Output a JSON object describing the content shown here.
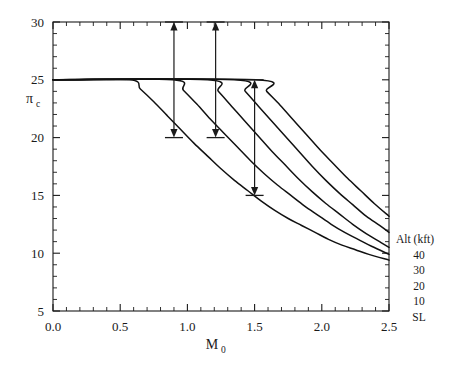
{
  "chart_data": {
    "type": "line",
    "title": "",
    "xlabel": "M_0",
    "xlabel_base": "M",
    "xlabel_sub": "0",
    "ylabel": "pi_c",
    "ylabel_base": "π",
    "ylabel_sub": "c",
    "xlim": [
      0.0,
      2.5
    ],
    "ylim": [
      5,
      30
    ],
    "grid": false,
    "xticks_major": [
      "0.0",
      "0.5",
      "1.0",
      "1.5",
      "2.0",
      "2.5"
    ],
    "xticks_major_values": [
      0.0,
      0.5,
      1.0,
      1.5,
      2.0,
      2.5
    ],
    "xtick_minor_step": 0.1,
    "yticks_major": [
      "5",
      "10",
      "15",
      "20",
      "25",
      "30"
    ],
    "yticks_major_values": [
      5,
      10,
      15,
      20,
      25,
      30
    ],
    "ytick_minor_step": 1,
    "legend_position": "right-outside",
    "legend_title": "Alt (kft)",
    "legend_entries": [
      "40",
      "30",
      "20",
      "10",
      "SL"
    ],
    "series": [
      {
        "name": "40",
        "label": "40",
        "break_x": 0.57,
        "plateau_y": 25,
        "points": [
          [
            0.0,
            25.0
          ],
          [
            0.57,
            25.0
          ],
          [
            0.65,
            24.2
          ],
          [
            0.75,
            23.1
          ],
          [
            0.85,
            21.9
          ],
          [
            0.95,
            20.7
          ],
          [
            1.05,
            19.5
          ],
          [
            1.15,
            18.4
          ],
          [
            1.25,
            17.3
          ],
          [
            1.35,
            16.3
          ],
          [
            1.45,
            15.4
          ],
          [
            1.55,
            14.5
          ],
          [
            1.65,
            13.7
          ],
          [
            1.75,
            13.0
          ],
          [
            1.85,
            12.4
          ],
          [
            1.95,
            11.8
          ],
          [
            2.05,
            11.2
          ],
          [
            2.15,
            10.7
          ],
          [
            2.25,
            10.3
          ],
          [
            2.35,
            9.9
          ],
          [
            2.5,
            9.4
          ]
        ]
      },
      {
        "name": "30",
        "label": "30",
        "break_x": 0.89,
        "plateau_y": 25,
        "points": [
          [
            0.0,
            25.0
          ],
          [
            0.89,
            25.0
          ],
          [
            0.97,
            24.1
          ],
          [
            1.07,
            22.9
          ],
          [
            1.17,
            21.6
          ],
          [
            1.27,
            20.4
          ],
          [
            1.37,
            19.2
          ],
          [
            1.47,
            18.0
          ],
          [
            1.57,
            16.9
          ],
          [
            1.67,
            15.9
          ],
          [
            1.77,
            15.0
          ],
          [
            1.87,
            14.1
          ],
          [
            1.97,
            13.3
          ],
          [
            2.07,
            12.5
          ],
          [
            2.17,
            11.8
          ],
          [
            2.27,
            11.2
          ],
          [
            2.37,
            10.6
          ],
          [
            2.5,
            9.9
          ]
        ]
      },
      {
        "name": "20",
        "label": "20",
        "break_x": 1.15,
        "plateau_y": 25,
        "points": [
          [
            0.0,
            25.0
          ],
          [
            1.15,
            25.0
          ],
          [
            1.23,
            24.0
          ],
          [
            1.33,
            22.7
          ],
          [
            1.43,
            21.4
          ],
          [
            1.53,
            20.1
          ],
          [
            1.63,
            18.8
          ],
          [
            1.73,
            17.6
          ],
          [
            1.83,
            16.4
          ],
          [
            1.93,
            15.3
          ],
          [
            2.03,
            14.3
          ],
          [
            2.13,
            13.4
          ],
          [
            2.23,
            12.5
          ],
          [
            2.33,
            11.7
          ],
          [
            2.43,
            11.0
          ],
          [
            2.5,
            10.5
          ]
        ]
      },
      {
        "name": "10",
        "label": "10",
        "break_x": 1.35,
        "plateau_y": 25,
        "points": [
          [
            0.0,
            25.0
          ],
          [
            1.35,
            25.0
          ],
          [
            1.43,
            24.0
          ],
          [
            1.53,
            22.7
          ],
          [
            1.63,
            21.4
          ],
          [
            1.73,
            20.1
          ],
          [
            1.83,
            18.8
          ],
          [
            1.93,
            17.5
          ],
          [
            2.03,
            16.3
          ],
          [
            2.13,
            15.2
          ],
          [
            2.23,
            14.2
          ],
          [
            2.33,
            13.2
          ],
          [
            2.43,
            12.4
          ],
          [
            2.5,
            11.8
          ]
        ]
      },
      {
        "name": "SL",
        "label": "SL",
        "break_x": 1.51,
        "plateau_y": 25,
        "points": [
          [
            0.0,
            25.0
          ],
          [
            1.51,
            25.0
          ],
          [
            1.59,
            24.0
          ],
          [
            1.69,
            22.8
          ],
          [
            1.79,
            21.5
          ],
          [
            1.89,
            20.2
          ],
          [
            1.99,
            18.9
          ],
          [
            2.09,
            17.7
          ],
          [
            2.19,
            16.5
          ],
          [
            2.29,
            15.4
          ],
          [
            2.39,
            14.3
          ],
          [
            2.5,
            13.2
          ]
        ]
      }
    ],
    "annotations": [
      {
        "name": "arrow-1",
        "type": "double-arrow-vertical",
        "x": 0.9,
        "y_top": 30.0,
        "y_bottom": 20.0,
        "cap_top": true,
        "cap_bottom": true
      },
      {
        "name": "arrow-2",
        "type": "double-arrow-vertical",
        "x": 1.21,
        "y_top": 30.0,
        "y_bottom": 20.0,
        "cap_top": true,
        "cap_bottom": true
      },
      {
        "name": "arrow-3",
        "type": "double-arrow-vertical",
        "x": 1.5,
        "y_top": 25.0,
        "y_bottom": 15.0,
        "cap_top": true,
        "cap_bottom": true
      }
    ]
  }
}
